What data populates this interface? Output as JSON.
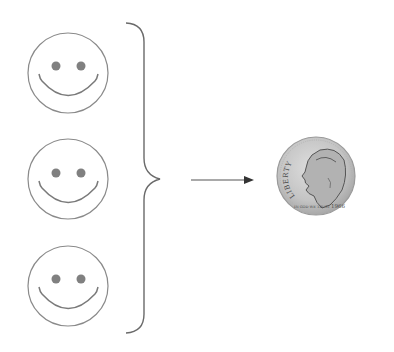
{
  "diagram": {
    "colors": {
      "stroke": "#8a8a8a",
      "eyes": "#808080",
      "coin_fill": "#c8c8c8",
      "coin_edge": "#9a9a9a"
    },
    "smileys": [
      {
        "label": "person-1"
      },
      {
        "label": "person-2"
      },
      {
        "label": "person-3"
      }
    ],
    "coin": {
      "legend": "LIBERTY",
      "motto": "IN GOD WE TRUST",
      "year": "1966"
    }
  }
}
